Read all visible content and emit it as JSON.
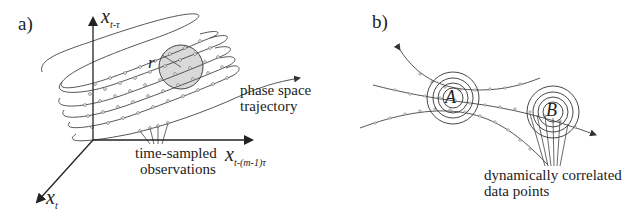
{
  "panel_a": {
    "tag": "a)",
    "axis_vertical": {
      "var": "x",
      "sub": "t-τ"
    },
    "axis_horizontal": {
      "var": "x",
      "sub": "t-(m-1)τ"
    },
    "axis_diagonal": {
      "var": "x",
      "sub": "t"
    },
    "radius_label": "r",
    "trajectory_label_line1": "phase space",
    "trajectory_label_line2": "trajectory",
    "observations_label_line1": "time-sampled",
    "observations_label_line2": "observations",
    "circle_fill": "#d9d9d9"
  },
  "panel_b": {
    "tag": "b)",
    "point_a": "A",
    "point_b": "B",
    "label_line1": "dynamically correlated",
    "label_line2": "data points"
  },
  "colors": {
    "stroke": "#3a3a3a",
    "background": "#ffffff"
  }
}
